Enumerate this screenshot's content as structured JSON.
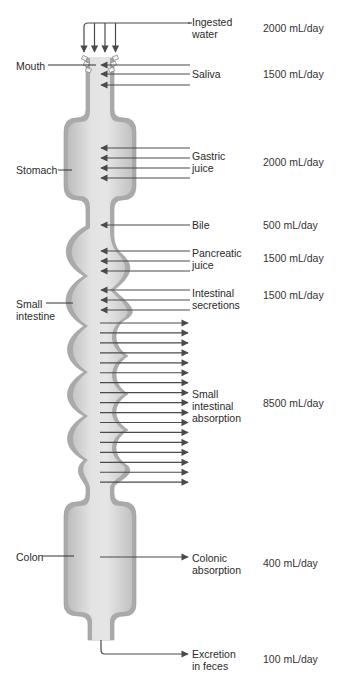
{
  "organs": [
    {
      "id": "mouth",
      "label": "Mouth"
    },
    {
      "id": "stomach",
      "label": "Stomach"
    },
    {
      "id": "small-intestine",
      "label": "Small\nintestine"
    },
    {
      "id": "colon",
      "label": "Colon"
    }
  ],
  "flows": [
    {
      "id": "ingested-water",
      "label": "Ingested\nwater",
      "value": "2000 mL/day",
      "direction": "in",
      "arrows": 4
    },
    {
      "id": "saliva",
      "label": "Saliva",
      "value": "1500 mL/day",
      "direction": "in",
      "arrows": 3
    },
    {
      "id": "gastric-juice",
      "label": "Gastric\njuice",
      "value": "2000 mL/day",
      "direction": "in",
      "arrows": 4
    },
    {
      "id": "bile",
      "label": "Bile",
      "value": "500 mL/day",
      "direction": "in",
      "arrows": 1
    },
    {
      "id": "pancreatic-juice",
      "label": "Pancreatic\njuice",
      "value": "1500 mL/day",
      "direction": "in",
      "arrows": 3
    },
    {
      "id": "intestinal-secretions",
      "label": "Intestinal\nsecretions",
      "value": "1500 mL/day",
      "direction": "in",
      "arrows": 3
    },
    {
      "id": "small-intestinal-absorption",
      "label": "Small\nintestinal\nabsorption",
      "value": "8500 mL/day",
      "direction": "out",
      "arrows": 17
    },
    {
      "id": "colonic-absorption",
      "label": "Colonic\nabsorption",
      "value": "400 mL/day",
      "direction": "out",
      "arrows": 1
    },
    {
      "id": "excretion-in-feces",
      "label": "Excretion\nin feces",
      "value": "100 mL/day",
      "direction": "out",
      "arrows": 1
    }
  ],
  "colors": {
    "tube_fill": "#d6d6d6",
    "tube_wall": "#a9a9a9",
    "arrow": "#4a4a4a"
  }
}
